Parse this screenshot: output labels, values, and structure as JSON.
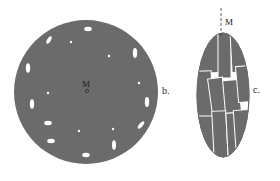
{
  "figure": {
    "panels": [
      {
        "id": "b",
        "label": "b.",
        "shape": "circle",
        "marker_label": "M",
        "fill": "#6b6b6b",
        "inclusion_color": "#ffffff"
      },
      {
        "id": "c",
        "label": "c.",
        "shape": "ellipse",
        "marker_label": "M",
        "fill": "#6b6b6b",
        "block_color": "#6b6b6b",
        "gap_color": "#ffffff"
      }
    ]
  }
}
